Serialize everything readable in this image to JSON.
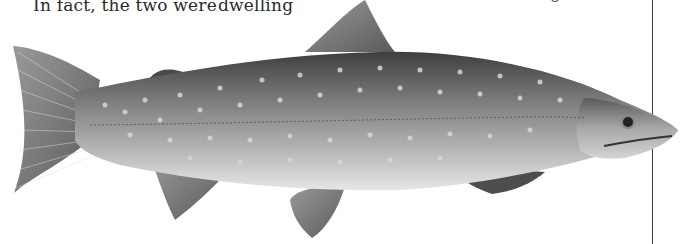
{
  "page": {
    "text_columns": [
      {
        "text": "In fact, the two were"
      },
      {
        "text": "dwelling"
      }
    ],
    "illustration": {
      "subject": "spotted trout / char (fish illustration)",
      "style": "grayscale engraving"
    },
    "colors": {
      "text": "#2a2a2a",
      "rule": "#3a3a3a",
      "fish_dark": "#4a4a4a",
      "fish_mid": "#8a8a8a",
      "fish_light": "#d8d8d8",
      "spot": "#cfcfcf"
    }
  }
}
